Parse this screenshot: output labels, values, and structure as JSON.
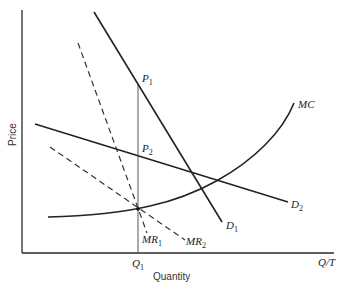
{
  "diagram": {
    "type": "economics-price-discrimination",
    "axes": {
      "y_label": "Price",
      "x_label": "Quantity",
      "x_end_label": "Q/T",
      "x_tick_label": {
        "main": "Q",
        "sub": "1"
      }
    },
    "curves": [
      {
        "id": "D1",
        "main": "D",
        "sub": "1",
        "style": "solid"
      },
      {
        "id": "D2",
        "main": "D",
        "sub": "2",
        "style": "solid"
      },
      {
        "id": "MR1",
        "main": "MR",
        "sub": "1",
        "style": "dashed"
      },
      {
        "id": "MR2",
        "main": "MR",
        "sub": "2",
        "style": "dashed"
      },
      {
        "id": "MC",
        "main": "MC",
        "sub": "",
        "style": "solid"
      }
    ],
    "points": [
      {
        "id": "P1",
        "main": "P",
        "sub": "1"
      },
      {
        "id": "P2",
        "main": "P",
        "sub": "2"
      }
    ],
    "colors": {
      "line": "#222222",
      "background": "#ffffff"
    }
  }
}
